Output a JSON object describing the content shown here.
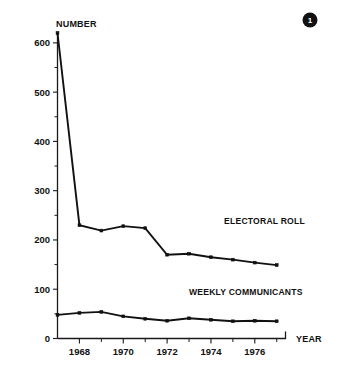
{
  "figure": {
    "badge_label": "1",
    "badge_color": "#111111"
  },
  "chart_data": {
    "type": "line",
    "title": "",
    "subtitle": "",
    "xlabel": "YEAR",
    "ylabel": "NUMBER",
    "ylim": [
      0,
      620
    ],
    "xlim": [
      1967,
      1977.4
    ],
    "grid": false,
    "legend_position": "inline-right",
    "y_ticks": [
      0,
      100,
      200,
      300,
      400,
      500,
      600
    ],
    "y_tick_labels": [
      "0",
      "100",
      "200",
      "300",
      "400",
      "500",
      "600"
    ],
    "y_minor_ticks": [
      50,
      150,
      250,
      350,
      450,
      550
    ],
    "x_ticks": [
      1968,
      1970,
      1972,
      1974,
      1976
    ],
    "x_tick_labels": [
      "1968",
      "1970",
      "1972",
      "1974",
      "1976"
    ],
    "x_minor_ticks": [
      1969,
      1971,
      1973,
      1975,
      1977
    ],
    "x": [
      1967,
      1968,
      1969,
      1970,
      1971,
      1972,
      1973,
      1974,
      1975,
      1976,
      1977
    ],
    "series": [
      {
        "name": "ELECTORAL ROLL",
        "label_x": 1974.6,
        "label_y": 232,
        "values": [
          620,
          230,
          219,
          228,
          224,
          170,
          172,
          165,
          160,
          154,
          149
        ]
      },
      {
        "name": "WEEKLY COMMUNICANTS",
        "label_x": 1973.0,
        "label_y": 88,
        "values": [
          48,
          52,
          54,
          45,
          40,
          36,
          41,
          38,
          35,
          36,
          35
        ]
      }
    ]
  }
}
